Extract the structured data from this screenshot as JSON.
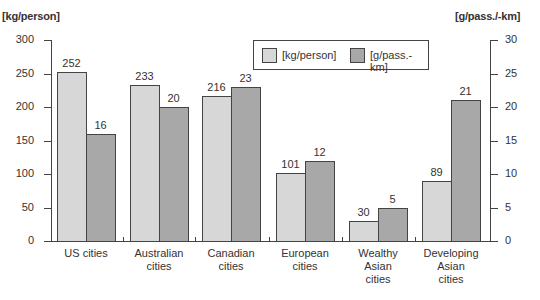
{
  "chart_data": {
    "type": "bar",
    "title": "",
    "xlabel": "",
    "ylabel": "[kg/person]",
    "y2label": "[g/pass./-km]",
    "ylim": [
      0,
      300
    ],
    "y2lim": [
      0,
      30
    ],
    "yticks": [
      "0",
      "50",
      "100",
      "150",
      "200",
      "250",
      "300"
    ],
    "y2ticks": [
      "0",
      "5",
      "10",
      "15",
      "20",
      "25",
      "30"
    ],
    "categories": [
      "US cities",
      "Australian cities",
      "Canadian cities",
      "European cities",
      "Wealthy Asian cities",
      "Developing Asian cities"
    ],
    "category_lines": [
      [
        "US cities"
      ],
      [
        "Australian",
        "cities"
      ],
      [
        "Canadian",
        "cities"
      ],
      [
        "European",
        "cities"
      ],
      [
        "Wealthy",
        "Asian",
        "cities"
      ],
      [
        "Developing",
        "Asian",
        "cities"
      ]
    ],
    "series": [
      {
        "name": "[kg/person]",
        "axis": "left",
        "color": "#d7d7d7",
        "values": [
          252,
          233,
          216,
          101,
          30,
          89
        ]
      },
      {
        "name": "[g/pass.-km]",
        "axis": "right",
        "color": "#a8a8a8",
        "values": [
          16,
          20,
          23,
          12,
          5,
          21
        ]
      }
    ],
    "legend": {
      "position": "top-center-right",
      "entries": [
        "[kg/person]",
        "[g/pass.-km]"
      ]
    },
    "grid": false
  }
}
